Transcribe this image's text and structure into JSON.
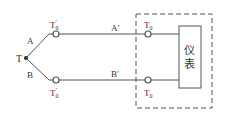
{
  "diagram": {
    "junction": {
      "label": "T"
    },
    "wires": {
      "upper_thermo": {
        "label": "A"
      },
      "lower_thermo": {
        "label": "B"
      },
      "upper_comp": {
        "label": "A′"
      },
      "lower_comp": {
        "label": "B′"
      }
    },
    "terminals": {
      "upper_mid": {
        "label": "T",
        "sub": "0",
        "prime": "′"
      },
      "lower_mid": {
        "label": "T",
        "sub": "0",
        "prime": "′"
      },
      "upper_end": {
        "label": "T",
        "sub": "0"
      },
      "lower_end": {
        "label": "T",
        "sub": "0"
      }
    },
    "instrument": {
      "line1": "仪",
      "line2": "表"
    },
    "enclosure": {
      "style": "dashed"
    },
    "colors": {
      "line": "#555555",
      "text": "#333333",
      "background": "#ffffff"
    }
  }
}
